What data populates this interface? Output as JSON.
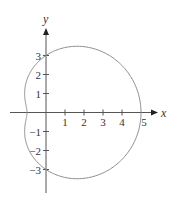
{
  "chart_data": {
    "type": "line",
    "subtype": "polar-curve",
    "title": "",
    "equation_family": "limacon",
    "polar": {
      "a": 3,
      "b": 2,
      "form": "r = a + b*cos(theta)"
    },
    "xlabel": "x",
    "ylabel": "y",
    "xlim": [
      -1.6,
      6.0
    ],
    "ylim": [
      -4.3,
      4.9
    ],
    "grid": false,
    "legend": null,
    "x_ticks": [
      1,
      2,
      3,
      4
    ],
    "x_tick_labels": [
      "1",
      "2",
      "3",
      "4",
      "5"
    ],
    "x_tick_label_values": [
      1,
      2,
      3,
      4,
      5
    ],
    "y_ticks": [
      -3,
      -2,
      -1,
      1,
      2,
      3
    ],
    "y_tick_labels": [
      "3",
      "2",
      "1",
      "−1",
      "−2",
      "−3"
    ],
    "y_tick_label_values": [
      3,
      2,
      1,
      -1,
      -2,
      -3
    ],
    "key_points": [
      {
        "x": 5,
        "y": 0
      },
      {
        "x": -1,
        "y": 0
      },
      {
        "x": 0,
        "y": 3
      },
      {
        "x": 0,
        "y": -3
      }
    ],
    "colors": {
      "curve": "#8c8c8c",
      "axes": "#555555",
      "text": "#333333"
    }
  },
  "layout": {
    "origin_px": [
      46,
      112.5
    ],
    "unit_px": 19,
    "x_axis_px": [
      10,
      158
    ],
    "y_axis_px": [
      28,
      193
    ]
  }
}
